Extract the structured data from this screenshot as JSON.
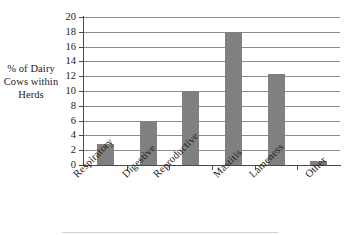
{
  "chart_data": {
    "type": "bar",
    "title": "",
    "xlabel": "",
    "ylabel": "% of Dairy Cows within Herds",
    "categories": [
      "Respiratory",
      "Digestive",
      "Reproductive",
      "Mastitis",
      "Lameness",
      "Other"
    ],
    "values": [
      2.8,
      6.0,
      10.0,
      18.0,
      12.3,
      0.5
    ],
    "ylim": [
      0,
      20
    ],
    "ytick_step": 2,
    "yticks": [
      "20",
      "18",
      "16",
      "14",
      "12",
      "10",
      "8",
      "6",
      "4",
      "2",
      "0"
    ],
    "grid": true,
    "legend": false,
    "bar_color": "#808080",
    "gridline_color": "#8c8c8c",
    "axis_color": "#4a4a4a",
    "label_rotation": -45
  },
  "axes": {
    "y_title_lines": [
      "% of Dairy",
      "Cows within",
      "Herds"
    ]
  },
  "caption": {
    "text": "————————————————————————"
  }
}
